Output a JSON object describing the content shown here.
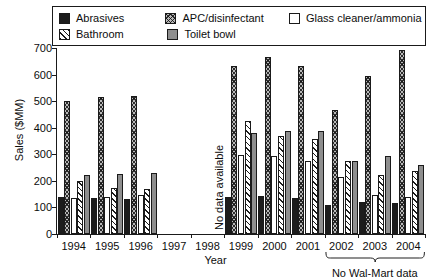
{
  "chart_data": {
    "type": "bar",
    "title": "",
    "xlabel": "Year",
    "ylabel": "Sales ($MM)",
    "ylim": [
      0,
      700
    ],
    "ytick_step": 100,
    "yticks": [
      0,
      100,
      200,
      300,
      400,
      500,
      600,
      700
    ],
    "grid": false,
    "legend_position": "top",
    "categories": [
      "1994",
      "1995",
      "1996",
      "1997",
      "1998",
      "1999",
      "2000",
      "2001",
      "2002",
      "2003",
      "2004"
    ],
    "series": [
      {
        "name": "Abrasives",
        "swatch": "solid-black",
        "color": "#1c1c1c",
        "values": [
          140,
          135,
          132,
          null,
          null,
          140,
          143,
          137,
          111,
          120,
          118
        ]
      },
      {
        "name": "APC/disinfectant",
        "swatch": "crosshatch",
        "color": "#b9b9b9",
        "values": [
          500,
          515,
          520,
          null,
          null,
          633,
          665,
          631,
          467,
          594,
          692
        ]
      },
      {
        "name": "Glass cleaner/ammonia",
        "swatch": "empty-white",
        "color": "#ffffff",
        "values": [
          136,
          139,
          146,
          null,
          null,
          298,
          293,
          275,
          214,
          145,
          138
        ]
      },
      {
        "name": "Bathroom",
        "swatch": "diagonal-hatch",
        "color": "#ffffff",
        "values": [
          199,
          172,
          169,
          null,
          null,
          424,
          369,
          356,
          275,
          222,
          239
        ]
      },
      {
        "name": "Toilet bowl",
        "swatch": "solid-gray",
        "color": "#8e8e8e",
        "values": [
          221,
          224,
          228,
          null,
          null,
          382,
          386,
          389,
          274,
          294,
          260
        ]
      }
    ],
    "annotations": [
      {
        "text": "No data available",
        "span": [
          "1997",
          "1998"
        ],
        "orientation": "vertical"
      },
      {
        "text": "No Wal-Mart data",
        "span": [
          "2002",
          "2004"
        ],
        "orientation": "horizontal"
      }
    ]
  },
  "legend": {
    "items": [
      {
        "label": "Abrasives"
      },
      {
        "label": "APC/disinfectant"
      },
      {
        "label": "Glass cleaner/ammonia"
      },
      {
        "label": "Bathroom"
      },
      {
        "label": "Toilet bowl"
      }
    ]
  },
  "axes": {
    "y_title": "Sales ($MM)",
    "x_title": "Year",
    "y_labels": [
      "700",
      "600",
      "500",
      "400",
      "300",
      "200",
      "100",
      "0"
    ]
  },
  "notes": {
    "no_data": "No data available",
    "no_walmart": "No Wal-Mart data"
  }
}
